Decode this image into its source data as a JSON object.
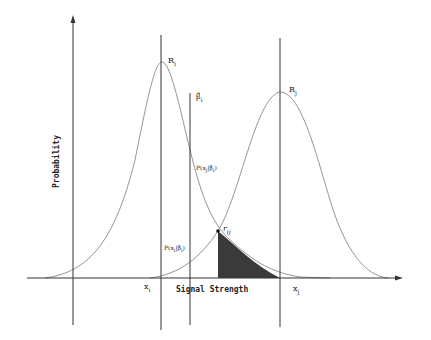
{
  "diagram": {
    "x_axis_label": "Signal Strength",
    "y_axis_label": "Probability",
    "curve_left_label": "R",
    "curve_left_sub": "i",
    "curve_right_label": "R",
    "curve_right_sub": "j",
    "beta_label": "β̂",
    "beta_sub": "i",
    "p_upper_label": "P(x",
    "p_upper_sub": "j",
    "p_upper_rest": "|β̂",
    "p_upper_rest_sub": "i",
    "p_upper_close": ")",
    "p_lower_label": "P(x",
    "p_lower_sub": "i",
    "p_lower_rest": "|β̂",
    "p_lower_rest_sub": "i",
    "p_lower_close": ")",
    "intersection_label": "r",
    "intersection_sub": "ij",
    "x_tick_left": "x",
    "x_tick_left_sub": "i",
    "x_tick_right": "x",
    "x_tick_right_sub": "j",
    "colors": {
      "line": "#333333",
      "curve": "#777777",
      "shade": "#3a3a3a",
      "background": "#ffffff"
    }
  }
}
